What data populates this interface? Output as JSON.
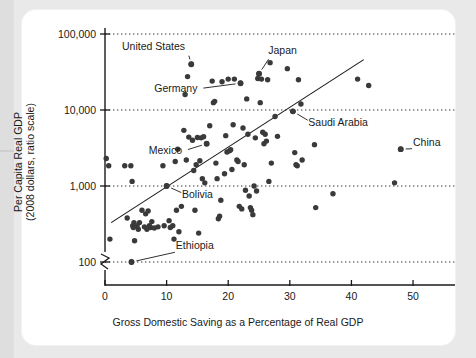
{
  "chart_data": {
    "type": "scatter",
    "title": "",
    "xlabel": "Gross Domestic Saving as a Percentage of Real GDP",
    "ylabel_line1": "Per Capita Real GDP",
    "ylabel_line2": "(2008 dollars, ratio scale)",
    "yscale": "log",
    "xlim": [
      0,
      56
    ],
    "ylim": [
      100,
      100000
    ],
    "xticks": [
      0,
      10,
      20,
      30,
      40,
      50
    ],
    "xtick_labels": [
      "0",
      "10",
      "20",
      "30",
      "40",
      "50"
    ],
    "yticks": [
      100,
      1000,
      10000,
      100000
    ],
    "ytick_labels": [
      "100",
      "1,000",
      "10,000",
      "100,000"
    ],
    "grid": "horizontal-dotted",
    "axis_break": true,
    "legend": "none",
    "trendline": {
      "x0": 1.0,
      "y0": 330,
      "x1": 42.0,
      "y1": 46000
    },
    "annotations": [
      {
        "label": "United States",
        "x": 14.0,
        "y": 40000,
        "text_x": 13.0,
        "text_y": 62000
      },
      {
        "label": "Japan",
        "x": 25.0,
        "y": 30000,
        "text_x": 26.5,
        "text_y": 55000
      },
      {
        "label": "Germany",
        "x": 22.0,
        "y": 22500,
        "text_x": 15.0,
        "text_y": 17000
      },
      {
        "label": "Saudi Arabia",
        "x": 30.5,
        "y": 9600,
        "text_x": 33.0,
        "text_y": 6200
      },
      {
        "label": "Mexico",
        "x": 16.5,
        "y": 3600,
        "text_x": 12.5,
        "text_y": 2600
      },
      {
        "label": "Bolivia",
        "x": 10.0,
        "y": 1000,
        "text_x": 12.5,
        "text_y": 700
      },
      {
        "label": "Ethiopia",
        "x": 4.3,
        "y": 100,
        "text_x": 11.5,
        "text_y": 150
      },
      {
        "label": "China",
        "x": 48.0,
        "y": 3050,
        "text_x": 50.0,
        "text_y": 3400
      }
    ],
    "points": [
      [
        0.2,
        2300
      ],
      [
        0.6,
        1850
      ],
      [
        0.8,
        200
      ],
      [
        3.2,
        1850
      ],
      [
        3.6,
        380
      ],
      [
        4.2,
        1850
      ],
      [
        4.3,
        100
      ],
      [
        4.4,
        1150
      ],
      [
        4.5,
        300
      ],
      [
        4.6,
        285
      ],
      [
        4.7,
        330
      ],
      [
        4.8,
        190
      ],
      [
        5.2,
        300
      ],
      [
        5.4,
        270
      ],
      [
        5.6,
        330
      ],
      [
        6.0,
        480
      ],
      [
        6.4,
        290
      ],
      [
        6.6,
        430
      ],
      [
        6.8,
        270
      ],
      [
        7.0,
        470
      ],
      [
        7.2,
        300
      ],
      [
        7.4,
        285
      ],
      [
        7.6,
        340
      ],
      [
        8.0,
        280
      ],
      [
        8.6,
        290
      ],
      [
        9.4,
        1850
      ],
      [
        9.6,
        300
      ],
      [
        10.0,
        1000
      ],
      [
        10.4,
        350
      ],
      [
        10.6,
        285
      ],
      [
        11.0,
        300
      ],
      [
        11.2,
        200
      ],
      [
        11.4,
        2100
      ],
      [
        11.6,
        480
      ],
      [
        11.8,
        3050
      ],
      [
        12.0,
        250
      ],
      [
        12.4,
        540
      ],
      [
        12.8,
        5400
      ],
      [
        13.0,
        16000
      ],
      [
        13.2,
        2200
      ],
      [
        13.4,
        27500
      ],
      [
        13.6,
        4400
      ],
      [
        14.0,
        40000
      ],
      [
        14.2,
        4000
      ],
      [
        14.4,
        1600
      ],
      [
        14.6,
        480
      ],
      [
        14.8,
        1900
      ],
      [
        15.0,
        4350
      ],
      [
        15.2,
        240
      ],
      [
        15.4,
        2150
      ],
      [
        15.6,
        4300
      ],
      [
        15.8,
        1250
      ],
      [
        16.0,
        4450
      ],
      [
        16.2,
        1100
      ],
      [
        16.5,
        3600
      ],
      [
        17.0,
        6200
      ],
      [
        17.4,
        24000
      ],
      [
        17.6,
        12500
      ],
      [
        17.8,
        13000
      ],
      [
        18.0,
        2000
      ],
      [
        18.2,
        1250
      ],
      [
        18.4,
        370
      ],
      [
        18.6,
        400
      ],
      [
        18.8,
        650
      ],
      [
        19.0,
        23500
      ],
      [
        19.4,
        1450
      ],
      [
        19.6,
        4600
      ],
      [
        19.8,
        2800
      ],
      [
        20.0,
        25500
      ],
      [
        20.2,
        2900
      ],
      [
        20.4,
        3000
      ],
      [
        20.6,
        1650
      ],
      [
        20.8,
        6400
      ],
      [
        21.0,
        25500
      ],
      [
        21.4,
        2200
      ],
      [
        21.6,
        2100
      ],
      [
        21.8,
        540
      ],
      [
        22.0,
        22500
      ],
      [
        22.2,
        500
      ],
      [
        22.4,
        5800
      ],
      [
        22.6,
        1900
      ],
      [
        22.8,
        880
      ],
      [
        23.0,
        14000
      ],
      [
        23.2,
        4800
      ],
      [
        23.4,
        740
      ],
      [
        23.6,
        520
      ],
      [
        23.8,
        480
      ],
      [
        24.0,
        420
      ],
      [
        24.2,
        1000
      ],
      [
        24.4,
        4300
      ],
      [
        24.6,
        860
      ],
      [
        24.8,
        26000
      ],
      [
        25.0,
        30000
      ],
      [
        25.2,
        12500
      ],
      [
        25.4,
        25500
      ],
      [
        25.6,
        5100
      ],
      [
        25.8,
        3600
      ],
      [
        26.0,
        4800
      ],
      [
        26.2,
        3900
      ],
      [
        26.4,
        25000
      ],
      [
        26.6,
        1150
      ],
      [
        26.8,
        42000
      ],
      [
        27.0,
        2000
      ],
      [
        27.6,
        8200
      ],
      [
        28.0,
        4500
      ],
      [
        29.6,
        35000
      ],
      [
        30.5,
        9600
      ],
      [
        30.8,
        2750
      ],
      [
        31.0,
        1900
      ],
      [
        31.2,
        1850
      ],
      [
        31.4,
        25000
      ],
      [
        31.8,
        12000
      ],
      [
        32.0,
        2200
      ],
      [
        34.0,
        3500
      ],
      [
        34.2,
        520
      ],
      [
        37.0,
        790
      ],
      [
        41.0,
        25500
      ],
      [
        42.8,
        21000
      ],
      [
        47.0,
        1100
      ],
      [
        48.0,
        3050
      ]
    ]
  }
}
